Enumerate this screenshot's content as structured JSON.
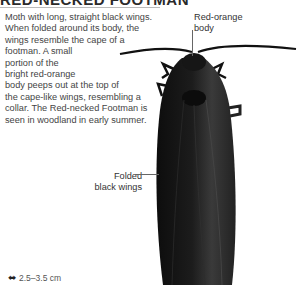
{
  "title": "RED-NECKED FOOTMAN",
  "description_lines": [
    "Moth with long, straight black wings.",
    "When folded around its body, the",
    "wings resemble the cape of a",
    "footman. A small",
    "portion of the",
    "bright red-orange",
    "body peeps out at the top of",
    "the cape-like wings, resembling a",
    "collar. The Red-necked Footman is",
    "seen in woodland in early summer."
  ],
  "annotations": {
    "body_line1": "Red-orange",
    "body_line2": "body",
    "wings_line1": "Folded",
    "wings_line2": "black wings"
  },
  "size": {
    "icon": "wingspan-arrows-icon",
    "value": "2.5–3.5 cm"
  },
  "colors": {
    "moth_body": "#1a1a1a",
    "moth_highlight": "#3a3a3a",
    "text": "#444444"
  }
}
